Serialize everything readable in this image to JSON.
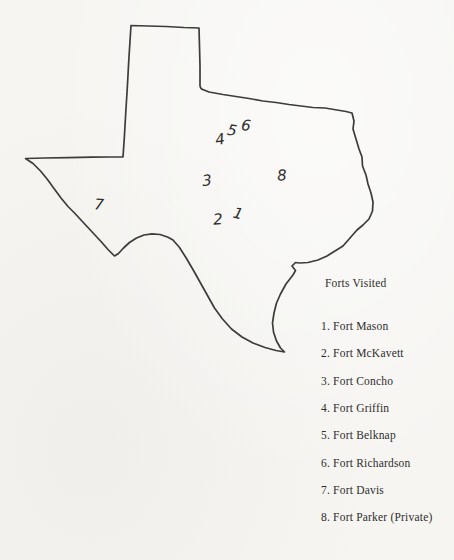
{
  "colors": {
    "paper": "#f6f5f2",
    "ink": "#3d3c3a",
    "text": "#2e2d2b"
  },
  "map": {
    "region": "Texas",
    "markers": [
      "1",
      "2",
      "3",
      "4",
      "5",
      "6",
      "7",
      "8"
    ]
  },
  "legend": {
    "title": "Forts Visited",
    "items": [
      "1. Fort Mason",
      "2. Fort McKavett",
      "3. Fort Concho",
      "4. Fort Griffin",
      "5. Fort Belknap",
      "6. Fort Richardson",
      "7. Fort Davis",
      "8. Fort Parker (Private)"
    ]
  }
}
